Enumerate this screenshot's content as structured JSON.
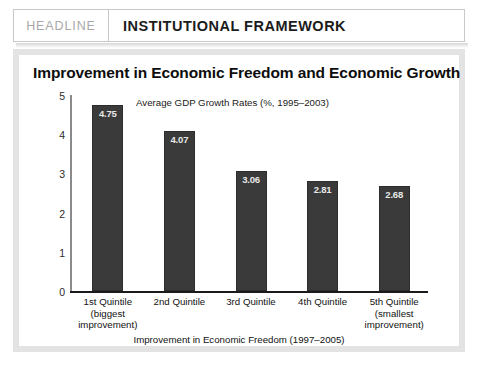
{
  "header": {
    "kicker": "HEADLINE",
    "title": "INSTITUTIONAL FRAMEWORK"
  },
  "chart_data": {
    "type": "bar",
    "title": "Improvement in Economic Freedom and Economic Growth",
    "subtitle": "Average GDP Growth Rates (%, 1995–2003)",
    "xlabel": "Improvement in Economic Freedom (1997–2005)",
    "ylabel": "",
    "ylim": [
      0,
      5
    ],
    "yticks": [
      "0",
      "1",
      "2",
      "3",
      "4",
      "5"
    ],
    "grid": false,
    "legend": null,
    "bar_color": "#3a3a3a",
    "categories": [
      "1st Quintile",
      "2nd Quintile",
      "3rd Quintile",
      "4th Quintile",
      "5th Quintile"
    ],
    "category_sublabels": [
      [
        "(biggest",
        "improvement)"
      ],
      [],
      [],
      [],
      [
        "(smallest",
        "improvement)"
      ]
    ],
    "values": [
      4.75,
      4.07,
      3.06,
      2.81,
      2.68
    ],
    "value_labels": [
      "4.75",
      "4.07",
      "3.06",
      "2.81",
      "2.68"
    ]
  }
}
